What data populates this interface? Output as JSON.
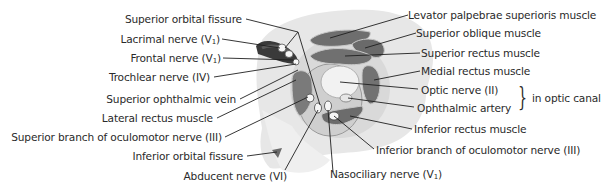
{
  "diagram": {
    "colors": {
      "text": "#2a2a2a",
      "leader_line": "#1f1f1f",
      "background_wash": "#e6e6e6",
      "muscle": "#6d6d6d",
      "dark_fissure": "#3a3a3a",
      "nerve_light": "#f4f4f4"
    },
    "labels_left": [
      {
        "id": "superior-orbital-fissure",
        "text": "Superior orbital fissure",
        "sub": ""
      },
      {
        "id": "lacrimal-nerve",
        "text": "Lacrimal nerve (V",
        "sub": "1",
        "suffix": ")"
      },
      {
        "id": "frontal-nerve",
        "text": "Frontal nerve (V",
        "sub": "1",
        "suffix": ")"
      },
      {
        "id": "trochlear-nerve",
        "text": "Trochlear nerve (IV)",
        "sub": ""
      },
      {
        "id": "superior-ophthalmic-vein",
        "text": "Superior ophthalmic vein",
        "sub": ""
      },
      {
        "id": "lateral-rectus-muscle",
        "text": "Lateral rectus muscle",
        "sub": ""
      },
      {
        "id": "superior-branch-oculomotor",
        "text": "Superior branch of oculomotor nerve (III)",
        "sub": ""
      },
      {
        "id": "inferior-orbital-fissure",
        "text": "Inferior orbital fissure",
        "sub": ""
      },
      {
        "id": "abducent-nerve",
        "text": "Abducent nerve (VI)",
        "sub": ""
      }
    ],
    "labels_right": [
      {
        "id": "levator-palpebrae",
        "text": "Levator palpebrae superioris muscle",
        "sub": ""
      },
      {
        "id": "superior-oblique",
        "text": "Superior oblique muscle",
        "sub": ""
      },
      {
        "id": "superior-rectus",
        "text": "Superior rectus muscle",
        "sub": ""
      },
      {
        "id": "medial-rectus",
        "text": "Medial rectus muscle",
        "sub": ""
      },
      {
        "id": "optic-nerve",
        "text": "Optic nerve (II)",
        "sub": ""
      },
      {
        "id": "ophthalmic-artery",
        "text": "Ophthalmic artery",
        "sub": ""
      },
      {
        "id": "inferior-rectus",
        "text": "Inferior rectus muscle",
        "sub": ""
      },
      {
        "id": "inferior-branch-oculomotor",
        "text": "Inferior branch of oculomotor nerve (III)",
        "sub": ""
      },
      {
        "id": "nasociliary-nerve",
        "text": "Nasociliary nerve (V",
        "sub": "1",
        "suffix": ")"
      }
    ],
    "group_annotation": {
      "brace_glyph": "}",
      "text": "in optic canal",
      "applies_to": [
        "Optic nerve (II)",
        "Ophthalmic artery"
      ]
    }
  }
}
